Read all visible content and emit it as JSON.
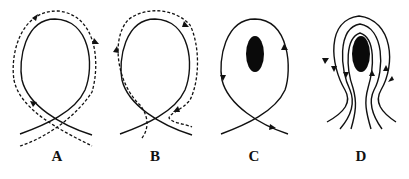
{
  "figure": {
    "panels": [
      {
        "id": "A",
        "label": "A",
        "description": "Closed loop field line with dashed path circulating clockwise around it, crossing at bottom",
        "obstacle": false
      },
      {
        "id": "B",
        "label": "B",
        "description": "Closed loop field line with dashed path circulating counter-clockwise, dashed line turning inward at bottom right",
        "obstacle": false
      },
      {
        "id": "C",
        "label": "C",
        "description": "Single loop flow line circulating around a dark elliptical obstacle, crossing below",
        "obstacle": true
      },
      {
        "id": "D",
        "label": "D",
        "description": "Multiple nested flow lines diverting around a dark elliptical obstacle",
        "obstacle": true
      }
    ],
    "colors": {
      "line": "#111111",
      "obstacle": "#0a0a0a",
      "background": "#ffffff"
    }
  }
}
